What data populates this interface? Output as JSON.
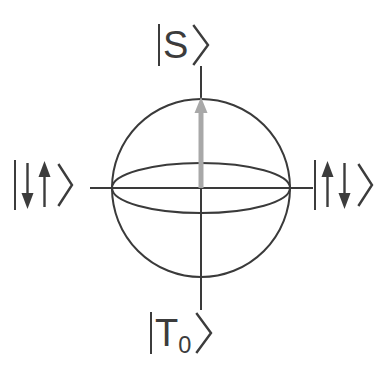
{
  "figure": {
    "name": "singlet-triplet-bloch-sphere",
    "background_color": "#ffffff",
    "line_color": "#3a3a3a",
    "vector_color": "#a8a8a8"
  },
  "sphere": {
    "center_x": 201,
    "center_y": 188,
    "radius": 89,
    "equator_ry": 25,
    "stroke_width": 2.0
  },
  "axes": {
    "vertical": {
      "x": 201,
      "y_top": 66,
      "y_bottom": 310
    },
    "horizontal": {
      "y": 188,
      "x_left": 90,
      "x_right": 313
    }
  },
  "bloch_vector": {
    "from_x": 201,
    "from_y": 188,
    "to_x": 201,
    "to_y": 97,
    "color": "#a8a8a8",
    "points_to": "north-pole",
    "head_width": 13,
    "head_length": 16,
    "shaft_width": 5
  },
  "labels": {
    "top": {
      "id": "label-top",
      "bra_bar": "|",
      "body": "S",
      "subscript": "",
      "ket_angle": "⟩",
      "full_text": "|S⟩",
      "pole": "north"
    },
    "bottom": {
      "id": "label-bottom",
      "bra_bar": "|",
      "body": "T",
      "subscript": "0",
      "ket_angle": "⟩",
      "full_text": "|T₀⟩",
      "pole": "south"
    },
    "left": {
      "id": "label-left",
      "bra_bar": "|",
      "spins": [
        "down",
        "up"
      ],
      "ket_angle": "⟩",
      "full_text": "|↓↑⟩",
      "pole": "west"
    },
    "right": {
      "id": "label-right",
      "bra_bar": "|",
      "spins": [
        "up",
        "down"
      ],
      "ket_angle": "⟩",
      "full_text": "|↑↓⟩",
      "pole": "east"
    }
  }
}
